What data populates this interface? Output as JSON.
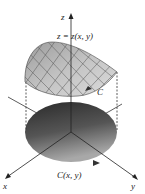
{
  "figure": {
    "labels": {
      "z_axis": "z",
      "x_axis": "x",
      "y_axis": "y",
      "surface": "z = z(x, y)",
      "space_curve": "C",
      "plane_curve": "C(x, y)"
    },
    "colors": {
      "surface_fill": "#bdbdbd",
      "surface_grid": "#555555",
      "disk_dark": "#2a2a2a",
      "disk_light": "#9a9a9a",
      "axis": "#333333"
    }
  }
}
